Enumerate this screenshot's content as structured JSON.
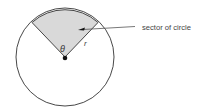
{
  "diagram": {
    "label": "sector of circle",
    "angle_symbol": "θ",
    "radius_symbol": "r",
    "colors": {
      "sector_fill": "#d9d9d9",
      "stroke": "#333333",
      "text": "#444444"
    }
  }
}
